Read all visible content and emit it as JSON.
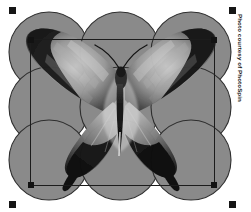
{
  "canvas": {
    "width": 251,
    "height": 212,
    "background_color": "#ffffff"
  },
  "artwork": {
    "name": "butterfly-over-circle-grid",
    "description": "Grayscale swallowtail butterfly photo composited over a 3x3 grid of overlapping gray circles",
    "circle_fill_color": "#8a8a8a",
    "circle_stroke_color": "#2e2e2e",
    "circle_rows": 3,
    "circle_columns": 3,
    "circle_diameter": 80,
    "grid_left": 13,
    "grid_top": 12,
    "grid_right": 228,
    "grid_bottom": 198,
    "photo_subject": "swallowtail butterfly"
  },
  "selection": {
    "label": "Selection bounding box",
    "x": 30,
    "y": 39,
    "width": 185,
    "height": 147,
    "stroke_color": "#1c1c1c",
    "handle_color": "#121212",
    "handles": [
      {
        "position": "top-left"
      },
      {
        "position": "top-right"
      },
      {
        "position": "bottom-left"
      },
      {
        "position": "bottom-right"
      }
    ]
  },
  "corner_markers": {
    "label": "Crop corner markers",
    "color": "#161616",
    "size": 7,
    "positions": [
      {
        "name": "top-left",
        "x": 9,
        "y": 7
      },
      {
        "name": "top-right",
        "x": 229,
        "y": 7
      },
      {
        "name": "bottom-left",
        "x": 9,
        "y": 201
      },
      {
        "name": "bottom-right",
        "x": 229,
        "y": 201
      }
    ]
  },
  "credit": {
    "text": "Photo courtesy of PhotoSpin",
    "orientation": "vertical",
    "color": "#1a1a1a"
  }
}
